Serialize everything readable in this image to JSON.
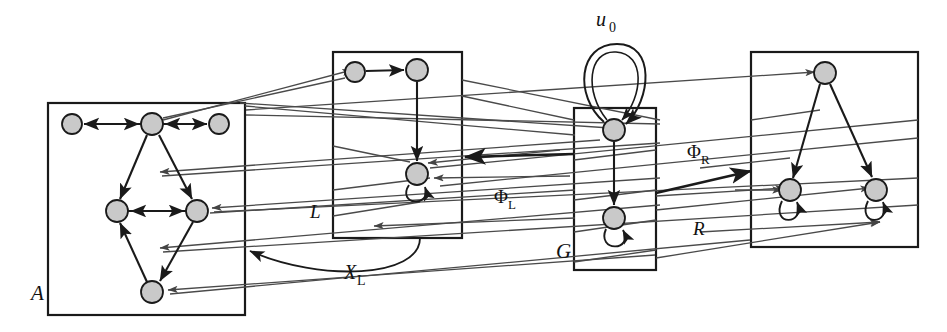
{
  "figure": {
    "type": "directed-graph-diagram",
    "background": "#ffffff",
    "width": 947,
    "height": 332,
    "node_fill": "#c9c9c9",
    "node_stroke": "#1a1a1a",
    "box_stroke": "#1a1a1a",
    "edge_color": "#1a1a1a",
    "thin_edge_color": "#555555"
  },
  "labels": {
    "box_a": "A",
    "box_g": "G",
    "graph_top_loop": "u",
    "graph_top_loop_sub": "0",
    "phi_left": "Φ",
    "phi_left_sub": "L",
    "phi_right": "Φ",
    "phi_right_sub": "R",
    "morphism_l": "L",
    "morphism_r": "R",
    "arc_x": "X",
    "arc_x_sub": "L"
  },
  "boxes": [
    {
      "name": "A",
      "label": "A",
      "x": 48,
      "y": 103,
      "w": 197,
      "h": 212,
      "label_x": 31,
      "label_y": 300
    },
    {
      "name": "XL",
      "label": "",
      "x": 333,
      "y": 52,
      "w": 129,
      "h": 186,
      "label_x": 0,
      "label_y": 0
    },
    {
      "name": "G",
      "label": "G",
      "x": 574,
      "y": 108,
      "w": 82,
      "h": 162,
      "label_x": 560,
      "label_y": 258
    },
    {
      "name": "R",
      "label": "",
      "x": 751,
      "y": 52,
      "w": 167,
      "h": 195,
      "label_x": 0,
      "label_y": 0
    }
  ],
  "nodes": {
    "box_a": [
      {
        "id": "a0",
        "cx": 72,
        "cy": 124,
        "r": 10
      },
      {
        "id": "a1",
        "cx": 152,
        "cy": 124,
        "r": 11
      },
      {
        "id": "a2",
        "cx": 219,
        "cy": 124,
        "r": 10
      },
      {
        "id": "a3",
        "cx": 117,
        "cy": 211,
        "r": 11
      },
      {
        "id": "a4",
        "cx": 197,
        "cy": 211,
        "r": 11
      },
      {
        "id": "a5",
        "cx": 152,
        "cy": 292,
        "r": 11
      }
    ],
    "box_xl": [
      {
        "id": "x0",
        "cx": 355,
        "cy": 72,
        "r": 10
      },
      {
        "id": "x1",
        "cx": 417,
        "cy": 70,
        "r": 11
      },
      {
        "id": "x2",
        "cx": 418,
        "cy": 174,
        "r": 11,
        "self_loop": true
      }
    ],
    "box_g": [
      {
        "id": "g0",
        "cx": 614,
        "cy": 130,
        "r": 11,
        "self_loop": true,
        "double_loop": true
      },
      {
        "id": "g1",
        "cx": 614,
        "cy": 218,
        "r": 11,
        "self_loop": true
      }
    ],
    "box_r": [
      {
        "id": "r0",
        "cx": 825,
        "cy": 73,
        "r": 11
      },
      {
        "id": "r1",
        "cx": 790,
        "cy": 190,
        "r": 11,
        "self_loop": true
      },
      {
        "id": "r2",
        "cx": 876,
        "cy": 190,
        "r": 11,
        "self_loop": true
      }
    ]
  },
  "label_positions": {
    "phi_left": {
      "x": 497,
      "y": 202
    },
    "phi_right": {
      "x": 690,
      "y": 157
    },
    "morphism_l": {
      "x": 314,
      "y": 216
    },
    "morphism_r": {
      "x": 697,
      "y": 233
    },
    "arc_x": {
      "x": 352,
      "y": 278
    },
    "u0": {
      "x": 600,
      "y": 25
    }
  }
}
